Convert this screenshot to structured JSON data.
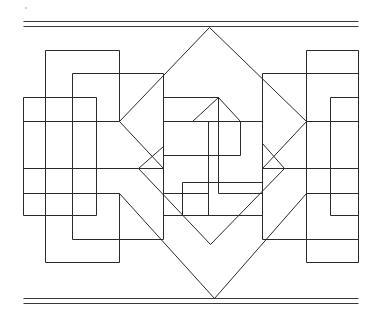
{
  "figure": {
    "width": 380,
    "height": 323,
    "stroke_color": "#2a2a2a",
    "background": "#ffffff",
    "border_rules": [
      {
        "name": "top-rule-1",
        "x1": 23,
        "y1": 21,
        "x2": 358,
        "y2": 21
      },
      {
        "name": "top-rule-2",
        "x1": 23,
        "y1": 26,
        "x2": 358,
        "y2": 26
      },
      {
        "name": "bottom-rule-1",
        "x1": 23,
        "y1": 298,
        "x2": 358,
        "y2": 298
      },
      {
        "name": "bottom-rule-2",
        "x1": 23,
        "y1": 303,
        "x2": 358,
        "y2": 303
      }
    ],
    "horizontal_lines": [
      [
        45,
        50,
        119,
        50
      ],
      [
        72,
        73,
        163,
        73
      ],
      [
        23,
        97,
        96,
        97
      ],
      [
        23,
        121,
        119,
        121
      ],
      [
        23,
        168,
        138,
        168
      ],
      [
        23,
        193,
        119,
        193
      ],
      [
        23,
        215,
        96,
        215
      ],
      [
        72,
        239,
        163,
        239
      ],
      [
        45,
        262,
        119,
        262
      ],
      [
        306,
        50,
        358,
        50
      ],
      [
        262,
        73,
        358,
        73
      ],
      [
        330,
        97,
        358,
        97
      ],
      [
        306,
        121,
        358,
        121
      ],
      [
        262,
        168,
        358,
        168
      ],
      [
        306,
        193,
        358,
        193
      ],
      [
        330,
        215,
        358,
        215
      ],
      [
        262,
        239,
        358,
        239
      ],
      [
        306,
        262,
        358,
        262
      ],
      [
        163,
        97,
        218,
        97
      ],
      [
        163,
        121,
        262,
        121
      ],
      [
        163,
        155,
        240,
        155
      ],
      [
        182,
        182,
        262,
        182
      ],
      [
        163,
        193,
        208,
        193
      ],
      [
        218,
        193,
        262,
        193
      ],
      [
        163,
        215,
        262,
        215
      ],
      [
        138,
        168,
        163,
        168
      ],
      [
        262,
        168,
        284,
        168
      ]
    ],
    "vertical_lines": [
      [
        23,
        97,
        23,
        215
      ],
      [
        45,
        50,
        45,
        262
      ],
      [
        72,
        73,
        72,
        239
      ],
      [
        96,
        97,
        96,
        215
      ],
      [
        119,
        50,
        119,
        121
      ],
      [
        119,
        193,
        119,
        262
      ],
      [
        163,
        73,
        163,
        239
      ],
      [
        262,
        73,
        262,
        239
      ],
      [
        306,
        50,
        306,
        262
      ],
      [
        330,
        97,
        330,
        215
      ],
      [
        358,
        50,
        358,
        262
      ],
      [
        208,
        121,
        208,
        215
      ],
      [
        218,
        97,
        218,
        193
      ],
      [
        240,
        121,
        240,
        155
      ],
      [
        182,
        182,
        182,
        215
      ]
    ],
    "diagonal_lines": [
      [
        209,
        27,
        119,
        121
      ],
      [
        209,
        27,
        306,
        121
      ],
      [
        119,
        121,
        163,
        168
      ],
      [
        306,
        121,
        262,
        168
      ],
      [
        138,
        168,
        163,
        146
      ],
      [
        284,
        168,
        262,
        143
      ],
      [
        138,
        168,
        210,
        244
      ],
      [
        284,
        168,
        210,
        244
      ],
      [
        119,
        193,
        214,
        298
      ],
      [
        306,
        193,
        214,
        298
      ],
      [
        192,
        121,
        218,
        97
      ],
      [
        218,
        97,
        240,
        121
      ]
    ],
    "specks": [
      [
        26,
        8
      ]
    ]
  }
}
